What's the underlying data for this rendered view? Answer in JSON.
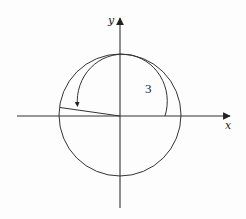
{
  "diagram": {
    "type": "unit-circle-angle",
    "axes": {
      "x_label": "x",
      "y_label": "y"
    },
    "angle": {
      "label": "3",
      "radians": 3,
      "direction": "counterclockwise"
    },
    "colors": {
      "stroke": "#333333",
      "background": "#fdfdfd"
    }
  }
}
